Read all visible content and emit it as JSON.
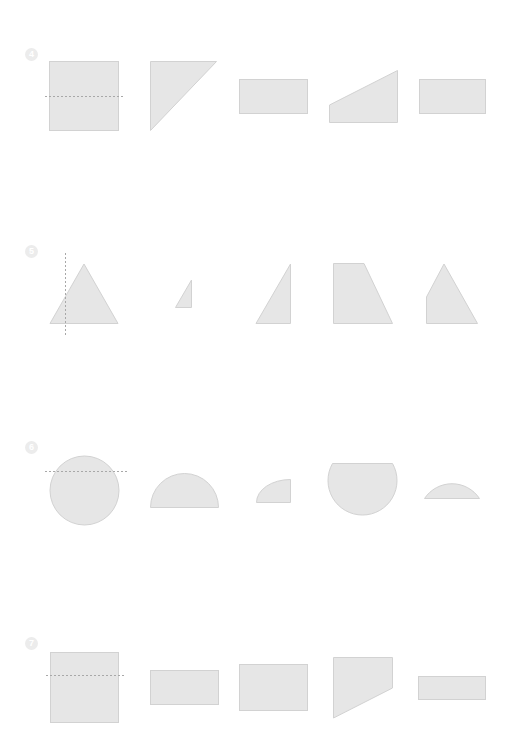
{
  "colors": {
    "shape_fill": "#e6e6e6",
    "shape_stroke": "#d2d2d2",
    "guide_line": "#a8a8a8",
    "badge": "#ececec",
    "background": "#ffffff"
  },
  "rows": [
    {
      "number": "4",
      "badge_icon": "circled-number-4-icon",
      "shapes": [
        "square-with-dashed-fold-line",
        "right-triangle",
        "rectangle",
        "right-trapezoid",
        "rectangle"
      ]
    },
    {
      "number": "5",
      "badge_icon": "circled-number-5-icon",
      "shapes": [
        "isosceles-triangle-with-dashed-fold-line",
        "small-right-triangle",
        "right-triangle",
        "right-trapezoid",
        "pentagon"
      ]
    },
    {
      "number": "6",
      "badge_icon": "circled-number-6-icon",
      "shapes": [
        "circle-with-dashed-fold-line",
        "semicircle",
        "quarter-circle",
        "major-circle-segment",
        "minor-circle-segment"
      ]
    },
    {
      "number": "7",
      "badge_icon": "circled-number-7-icon",
      "shapes": [
        "square-with-dashed-fold-line",
        "rectangle",
        "rectangle",
        "trapezoid",
        "rectangle"
      ]
    }
  ]
}
